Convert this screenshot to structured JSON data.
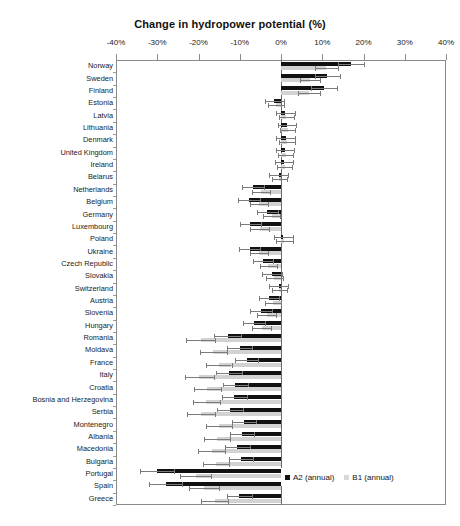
{
  "chart_data": {
    "type": "bar",
    "orientation": "horizontal",
    "title": "Change in hydropower potential (%)",
    "xlabel": "",
    "ylabel": "",
    "xlim": [
      -40,
      40
    ],
    "xticks": [
      -40,
      -30,
      -20,
      -10,
      0,
      10,
      20,
      30,
      40
    ],
    "xtick_labels": [
      "-40%",
      "-30%",
      "-20%",
      "-10%",
      "0%",
      "10%",
      "20%",
      "30%",
      "40%"
    ],
    "grid": false,
    "legend_position": "bottom-right",
    "categories": [
      "Norway",
      "Sweden",
      "Finland",
      "Estonia",
      "Latvia",
      "Lithuania",
      "Denmark",
      "United Kingdom",
      "Ireland",
      "Belarus",
      "Netherlands",
      "Belgium",
      "Germany",
      "Luxembourg",
      "Poland",
      "Ukraine",
      "Czech Republic",
      "Slovakia",
      "Switzerland",
      "Austria",
      "Slovenia",
      "Hungary",
      "Romania",
      "Moldava",
      "France",
      "Italy",
      "Croatia",
      "Bosnia and Herzegovina",
      "Serbia",
      "Montenegro",
      "Albania",
      "Macedonia",
      "Bulgaria",
      "Portugal",
      "Spain",
      "Greece"
    ],
    "series": [
      {
        "name": "A2 (annual)",
        "color": "#111111",
        "values": [
          17.0,
          11.2,
          10.4,
          -1.6,
          1.0,
          1.4,
          1.2,
          0.9,
          0.7,
          -0.6,
          -6.8,
          -7.8,
          -3.3,
          -7.4,
          0.6,
          -7.6,
          -4.4,
          -2.2,
          -0.5,
          -2.9,
          -4.9,
          -6.6,
          -12.9,
          -10.0,
          -8.3,
          -12.6,
          -11.1,
          -11.3,
          -12.4,
          -9.0,
          -9.4,
          -10.6,
          -9.8,
          -30.1,
          -27.9,
          -10.1
        ],
        "errors": [
          3.2,
          3.0,
          3.1,
          2.4,
          2.3,
          2.2,
          2.3,
          2.2,
          2.1,
          2.2,
          2.6,
          2.6,
          2.5,
          2.6,
          2.4,
          2.6,
          2.5,
          2.4,
          2.3,
          2.4,
          2.6,
          2.7,
          3.3,
          3.0,
          2.8,
          3.2,
          3.0,
          3.0,
          3.1,
          2.9,
          2.9,
          3.0,
          2.9,
          4.2,
          4.0,
          3.0
        ]
      },
      {
        "name": "B1 (annual)",
        "color": "#d2d2d2",
        "values": [
          11.0,
          7.0,
          6.8,
          -1.2,
          1.3,
          1.6,
          1.4,
          1.1,
          0.9,
          -0.4,
          -4.8,
          -5.4,
          -2.3,
          -5.2,
          0.8,
          -5.4,
          -3.1,
          -1.6,
          -0.4,
          -2.0,
          -3.5,
          -4.7,
          -19.5,
          -16.4,
          -15.1,
          -19.8,
          -17.9,
          -18.1,
          -19.3,
          -15.0,
          -15.5,
          -16.8,
          -15.8,
          -20.7,
          -18.6,
          -16.1
        ],
        "errors": [
          2.7,
          2.5,
          2.6,
          2.0,
          1.9,
          1.9,
          1.9,
          1.8,
          1.8,
          1.8,
          2.2,
          2.2,
          2.1,
          2.2,
          2.0,
          2.2,
          2.1,
          2.0,
          1.9,
          2.0,
          2.2,
          2.3,
          3.6,
          3.3,
          3.1,
          3.5,
          3.3,
          3.3,
          3.4,
          3.2,
          3.2,
          3.3,
          3.2,
          3.8,
          3.6,
          3.3
        ]
      }
    ],
    "legend": [
      {
        "label": "A2 (annual)",
        "color": "#111111"
      },
      {
        "label": "B1 (annual)",
        "color": "#d8d8d8"
      }
    ]
  }
}
